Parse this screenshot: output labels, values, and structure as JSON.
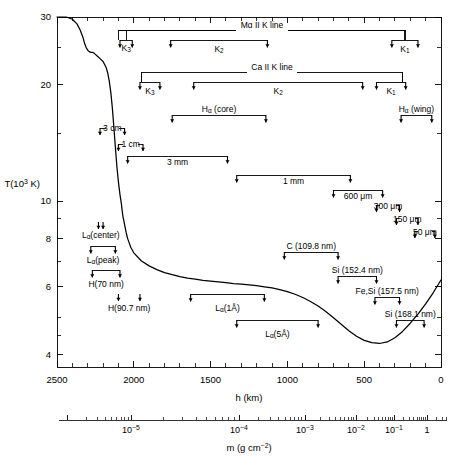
{
  "figure": {
    "line_color": "#000000",
    "bracket_color": "#000000",
    "background": "#ffffff"
  },
  "axes": {
    "y": {
      "label_main": "T(10",
      "label_exp": "3",
      "label_tail": " K)",
      "ticks": [
        30,
        20,
        10,
        8,
        6,
        4
      ],
      "tick_labels": [
        "30",
        "20",
        "10",
        "8",
        "6",
        "4"
      ],
      "minor_ticks": [
        25,
        15,
        9,
        7,
        5,
        4.5
      ],
      "range": [
        3.7,
        30
      ],
      "scale": "log"
    },
    "x_primary": {
      "title": "h (km)",
      "ticks": [
        2500,
        2000,
        1500,
        1000,
        500,
        0
      ],
      "tick_labels": [
        "2500",
        "2000",
        "1500",
        "1000",
        "500",
        "0"
      ],
      "range": [
        2500,
        0
      ],
      "direction": "decreasing"
    },
    "x_secondary": {
      "title_main": "m (g cm",
      "title_exp": "−2",
      "title_tail": ")",
      "tick_labels": [
        "10",
        "10",
        "10",
        "10",
        "10",
        "1"
      ],
      "tick_exponents": [
        "−5",
        "−4",
        "−3",
        "−2",
        "−1",
        ""
      ],
      "scale": "log"
    }
  },
  "chart_data": {
    "type": "line",
    "title": "",
    "xlabel": "h (km)",
    "ylabel": "T(10^3 K)",
    "xlim": [
      2500,
      0
    ],
    "ylim": [
      3.7,
      30
    ],
    "yscale": "log",
    "grid": false,
    "legend": "none",
    "series": [
      {
        "name": "Temperature",
        "x": [
          2500,
          2440,
          2400,
          2370,
          2350,
          2330,
          2320,
          2310,
          2300,
          2290,
          2280,
          2270,
          2260,
          2250,
          2240,
          2220,
          2200,
          2180,
          2170,
          2160,
          2150,
          2140,
          2130,
          2120,
          2110,
          2100,
          2090,
          2080,
          2075,
          2070,
          2065,
          2060,
          2055,
          2050,
          2045,
          2040,
          2030,
          2020,
          2000,
          1950,
          1900,
          1850,
          1800,
          1750,
          1700,
          1650,
          1600,
          1550,
          1500,
          1450,
          1400,
          1350,
          1300,
          1250,
          1200,
          1150,
          1100,
          1050,
          1000,
          950,
          900,
          850,
          800,
          750,
          700,
          650,
          600,
          550,
          500,
          450,
          400,
          350,
          300,
          250,
          200,
          150,
          100,
          50,
          0
        ],
        "y": [
          30,
          30,
          29.6,
          28.8,
          27.8,
          26.5,
          25.6,
          25.0,
          24.6,
          24.4,
          24.3,
          24.3,
          24.2,
          24.0,
          23.8,
          23.4,
          23.0,
          22.2,
          21.5,
          20.5,
          19.2,
          17.5,
          15.6,
          13.8,
          12.3,
          11.2,
          10.4,
          9.8,
          9.4,
          9.1,
          8.9,
          8.7,
          8.5,
          8.3,
          8.15,
          8.0,
          7.8,
          7.6,
          7.35,
          7.0,
          6.8,
          6.65,
          6.53,
          6.45,
          6.38,
          6.32,
          6.28,
          6.24,
          6.21,
          6.18,
          6.15,
          6.12,
          6.1,
          6.07,
          6.04,
          6.0,
          5.96,
          5.9,
          5.83,
          5.74,
          5.63,
          5.5,
          5.35,
          5.18,
          4.99,
          4.8,
          4.62,
          4.47,
          4.36,
          4.3,
          4.28,
          4.32,
          4.43,
          4.6,
          4.83,
          5.1,
          5.42,
          5.8,
          6.25
        ]
      }
    ],
    "annotations": [
      {
        "label": "Mg II K line",
        "group": "mg2k",
        "h_left": 2100,
        "h_right": 230,
        "row": 0
      },
      {
        "label": "K",
        "sub": "3",
        "group": "mg2k",
        "h_left": 2090,
        "h_right": 2010,
        "row": 1
      },
      {
        "label": "K",
        "sub": "2",
        "group": "mg2k",
        "h_left": 1760,
        "h_right": 1130,
        "row": 1
      },
      {
        "label": "K",
        "sub": "1",
        "group": "mg2k",
        "h_left": 320,
        "h_right": 150,
        "row": 1
      },
      {
        "label": "Ca II K line",
        "group": "ca2k",
        "h_left": 1950,
        "h_right": 250,
        "row": 2
      },
      {
        "label": "K",
        "sub": "3",
        "group": "ca2k",
        "h_left": 1960,
        "h_right": 1830,
        "row": 3
      },
      {
        "label": "K",
        "sub": "2",
        "group": "ca2k",
        "h_left": 1610,
        "h_right": 510,
        "row": 3
      },
      {
        "label": "K",
        "sub": "1",
        "group": "ca2k",
        "h_left": 420,
        "h_right": 230,
        "row": 3
      },
      {
        "label": "Hα (core)",
        "h_left": 1750,
        "h_right": 1140,
        "row": 4
      },
      {
        "label": "Hα (wing)",
        "h_left": 260,
        "h_right": 60,
        "row": 4
      },
      {
        "label": "3 cm",
        "h_left": 2220,
        "h_right": 2060,
        "row": 5
      },
      {
        "label": "1 cm",
        "h_left": 2100,
        "h_right": 1940,
        "row": 6
      },
      {
        "label": "3 mm",
        "h_left": 2040,
        "h_right": 1390,
        "row": 7
      },
      {
        "label": "1 mm",
        "h_left": 1330,
        "h_right": 590,
        "row": 8
      },
      {
        "label": "600 μm",
        "h_left": 700,
        "h_right": 380,
        "row": 9
      },
      {
        "label": "300 μm",
        "h_left": 420,
        "h_right": 270,
        "row": 10
      },
      {
        "label": "150 μm",
        "h_left": 290,
        "h_right": 150,
        "row": 11
      },
      {
        "label": "50 μm",
        "h_left": 170,
        "h_right": 40,
        "row": 12
      },
      {
        "label": "Lα(center)",
        "h_left": 2230,
        "h_right": 2200,
        "row": 13
      },
      {
        "label": "Lα(peak)",
        "h_left": 2280,
        "h_right": 2120,
        "row": 14
      },
      {
        "label": "H(70 nm)",
        "h_left": 2270,
        "h_right": 2090,
        "row": 15
      },
      {
        "label": "H(90.7 nm)",
        "h_left": 2100,
        "h_right": 1960,
        "row": 16
      },
      {
        "label": "Lα(1Å)",
        "h_left": 1630,
        "h_right": 1150,
        "row": 16
      },
      {
        "label": "Lα(5Å)",
        "h_left": 1330,
        "h_right": 800,
        "row": 17
      },
      {
        "label": "C (109.8 nm)",
        "h_left": 1020,
        "h_right": 670,
        "row": 18
      },
      {
        "label": "Si (152.4 nm)",
        "h_left": 670,
        "h_right": 420,
        "row": 19
      },
      {
        "label": "Fe,Si (157.5 nm)",
        "h_left": 430,
        "h_right": 270,
        "row": 20
      },
      {
        "label": "Si (168.1 nm)",
        "h_left": 290,
        "h_right": 110,
        "row": 21
      }
    ]
  },
  "labels": {
    "mg_line": "Mg II K line",
    "ca_line": "Ca II K line",
    "k3": "K",
    "k2": "K",
    "k1": "K",
    "sub3": "3",
    "sub2": "2",
    "sub1": "1",
    "ha_core": "H",
    "ha_core_tail": " (core)",
    "ha_wing": "H",
    "ha_wing_tail": " (wing)",
    "alpha": "α",
    "cm3": "3 cm",
    "cm1": "1 cm",
    "mm3": "3 mm",
    "mm1": "1 mm",
    "um600": "600 μm",
    "um300": "300 μm",
    "um150": "150 μm",
    "um50": "50 μm",
    "la_center": "(center)",
    "la_peak": "(peak)",
    "h70": "H(70 nm)",
    "h907": "H(90.7 nm)",
    "la_1a": "(1Å)",
    "la_5a": "(5Å)",
    "c1098": "C (109.8 nm)",
    "si1524": "Si (152.4 nm)",
    "fesi1575": "Fe,Si (157.5 nm)",
    "si1681": "Si (168.1 nm)",
    "L": "L"
  }
}
